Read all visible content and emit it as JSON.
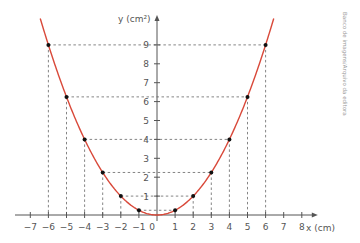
{
  "chart_data": {
    "type": "line",
    "title": "",
    "xlabel": "x (cm)",
    "ylabel": "y (cm²)",
    "xlim": [
      -7,
      8
    ],
    "ylim": [
      0,
      9
    ],
    "grid": false,
    "function": "y = x²/4",
    "x_ticks": [
      "−7",
      "−6",
      "−5",
      "−4",
      "−3",
      "−2",
      "−1",
      "0",
      "1",
      "2",
      "3",
      "4",
      "5",
      "6",
      "7",
      "8"
    ],
    "y_ticks": [
      "1",
      "2",
      "3",
      "4",
      "5",
      "6",
      "7",
      "8",
      "9"
    ],
    "series": [
      {
        "name": "parabola",
        "color": "#d9493a",
        "points": [
          {
            "x": -6,
            "y": 9
          },
          {
            "x": -5,
            "y": 6.25
          },
          {
            "x": -4,
            "y": 4
          },
          {
            "x": -3,
            "y": 2.25
          },
          {
            "x": -2,
            "y": 1
          },
          {
            "x": -1,
            "y": 0.25
          },
          {
            "x": 1,
            "y": 0.25
          },
          {
            "x": 2,
            "y": 1
          },
          {
            "x": 3,
            "y": 2.25
          },
          {
            "x": 4,
            "y": 4
          },
          {
            "x": 5,
            "y": 6.25
          },
          {
            "x": 6,
            "y": 9
          }
        ]
      }
    ]
  },
  "labels": {
    "x_axis": "x (cm)",
    "y_axis": "y (cm²)",
    "credit": "Banco de imagens/Arquivo da editora"
  },
  "colors": {
    "curve": "#d9493a",
    "axis": "#555555",
    "guide": "#666666",
    "point": "#111111"
  }
}
